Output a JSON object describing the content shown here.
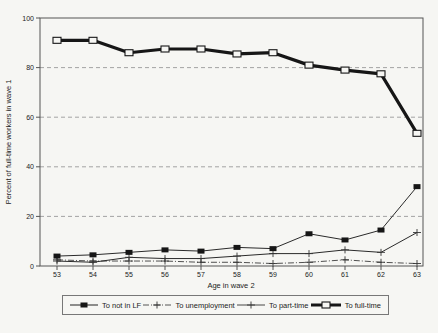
{
  "figure": {
    "background": "#f6f6f3",
    "frame_color": "#555555",
    "grid_color": "#9a9a9a",
    "ink_color": "#161616"
  },
  "chart_data": {
    "type": "line",
    "title": "",
    "xlabel": "Age in wave 2",
    "ylabel": "Percent of full-time workers in wave 1",
    "categories": [
      "53",
      "54",
      "55",
      "56",
      "57",
      "58",
      "59",
      "60",
      "61",
      "62",
      "63"
    ],
    "y_ticks": [
      "0",
      "20",
      "40",
      "60",
      "80",
      "100"
    ],
    "ylim": [
      0,
      100
    ],
    "grid": "dashed horizontal gridlines at 20, 40, 60, 80",
    "legend_position": "bottom",
    "series": [
      {
        "name": "To not in LF",
        "marker": "filled-square",
        "line_style": "thin-solid",
        "values": [
          4,
          4.5,
          5.5,
          6.5,
          6,
          7.5,
          7,
          13,
          10.5,
          14.5,
          32
        ]
      },
      {
        "name": "To unemployment",
        "marker": "plus",
        "line_style": "thin-dash-dot",
        "values": [
          2.5,
          2,
          2,
          2,
          1.5,
          1.5,
          1,
          1.5,
          2.5,
          1.5,
          1
        ]
      },
      {
        "name": "To part-time",
        "marker": "plus",
        "line_style": "thin-solid",
        "values": [
          2,
          1.5,
          3.5,
          3,
          3,
          4,
          5,
          5,
          6.5,
          5.5,
          13.5
        ]
      },
      {
        "name": "To full-time",
        "marker": "open-square",
        "line_style": "thick-solid",
        "values": [
          91,
          91,
          86,
          87.5,
          87.5,
          85.5,
          86,
          81,
          79,
          77.5,
          53.5
        ]
      }
    ]
  }
}
